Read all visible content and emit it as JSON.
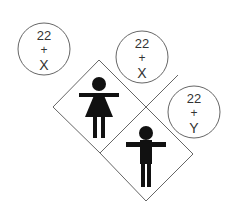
{
  "diagram": {
    "circles": [
      {
        "id": "egg",
        "line1": "22",
        "line2": "+",
        "line3": "X"
      },
      {
        "id": "sperm-x",
        "line1": "22",
        "line2": "+",
        "line3": "X"
      },
      {
        "id": "sperm-y",
        "line1": "22",
        "line2": "+",
        "line3": "Y"
      }
    ],
    "figures": [
      {
        "id": "female",
        "icon": "female-figure-icon"
      },
      {
        "id": "male",
        "icon": "male-figure-icon"
      }
    ],
    "colors": {
      "stroke": "#555555",
      "figure": "#111111",
      "text": "#333333",
      "background": "#ffffff"
    }
  }
}
